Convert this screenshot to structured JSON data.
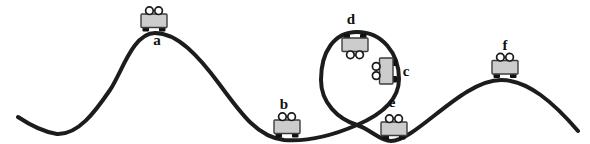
{
  "figure": {
    "colors": {
      "background": "#ffffff",
      "track": "#1c1c1c",
      "cart_body": "#cccccc",
      "cart_outline": "#3c3c3c",
      "wheel": "#111111",
      "rider": "#ffffff",
      "rider_outline": "#1a1a1a",
      "label": "#111111"
    },
    "carts": [
      {
        "label": "a"
      },
      {
        "label": "b"
      },
      {
        "label": "c"
      },
      {
        "label": "d"
      },
      {
        "label": "e"
      },
      {
        "label": "f"
      }
    ]
  }
}
